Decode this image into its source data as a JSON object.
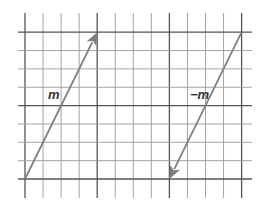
{
  "diagram": {
    "grid": {
      "columns": 12,
      "rows": 8,
      "major_every": 4,
      "line_color": "#9a9a9a",
      "major_color": "#555555"
    },
    "vectors": [
      {
        "name": "m",
        "label": "m",
        "from": [
          0,
          0
        ],
        "to": [
          4,
          8
        ],
        "color": "#808080"
      },
      {
        "name": "neg-m",
        "label": "−m",
        "from": [
          12,
          8
        ],
        "to": [
          8,
          0
        ],
        "color": "#808080"
      }
    ]
  }
}
